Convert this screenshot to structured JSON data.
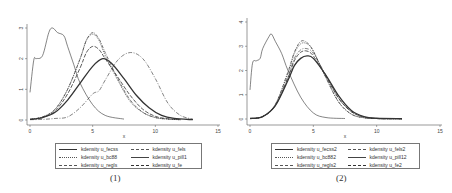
{
  "figure": {
    "panels": [
      {
        "label": "(1)",
        "xlabel": "x"
      },
      {
        "label": "(2)",
        "xlabel": "x"
      }
    ]
  },
  "chart_data": [
    {
      "type": "line",
      "title": "(1)",
      "xlabel": "x",
      "ylabel": "",
      "xlim": [
        0,
        15
      ],
      "ylim": [
        0,
        3
      ],
      "xticks": [
        0,
        5,
        10,
        15
      ],
      "yticks": [
        0,
        1,
        2,
        3
      ],
      "grid": false,
      "legend_position": "bottom",
      "series": [
        {
          "name": "kdensity u_fecss",
          "style": "solid-thick",
          "x": [
            0,
            1,
            2,
            3,
            4,
            5,
            5.8,
            6.5,
            7.5,
            8.5,
            9.5,
            10.5,
            11.5,
            13
          ],
          "y": [
            0.02,
            0.08,
            0.25,
            0.65,
            1.2,
            1.75,
            2.0,
            1.85,
            1.35,
            0.8,
            0.4,
            0.15,
            0.05,
            0.01
          ]
        },
        {
          "name": "kdensity u_bc88",
          "style": "dotted",
          "x": [
            0,
            1,
            2,
            3,
            4,
            4.5,
            5,
            5.5,
            6,
            7,
            8,
            9,
            10,
            11,
            12
          ],
          "y": [
            0.02,
            0.1,
            0.35,
            1.0,
            2.0,
            2.6,
            2.8,
            2.6,
            2.1,
            1.3,
            0.6,
            0.25,
            0.08,
            0.03,
            0.01
          ]
        },
        {
          "name": "kdensity u_regls",
          "style": "dash-dot",
          "x": [
            0,
            1,
            2,
            3,
            4,
            4.5,
            5,
            5.5,
            6,
            7,
            8,
            9,
            10,
            11,
            12
          ],
          "y": [
            0.02,
            0.1,
            0.35,
            1.0,
            2.0,
            2.6,
            2.85,
            2.65,
            2.2,
            1.35,
            0.65,
            0.25,
            0.08,
            0.03,
            0.01
          ]
        },
        {
          "name": "kdensity u_fels",
          "style": "long-dash-dot",
          "x": [
            0,
            1,
            2,
            3,
            4,
            5,
            5.5,
            6,
            7,
            8,
            9,
            10,
            11,
            12,
            13
          ],
          "y": [
            0.01,
            0.02,
            0.05,
            0.1,
            0.4,
            0.85,
            0.95,
            1.3,
            1.95,
            2.2,
            2.0,
            1.35,
            0.55,
            0.15,
            0.03
          ]
        },
        {
          "name": "kdensity u_pill1",
          "style": "solid-thin",
          "x": [
            0,
            0.3,
            0.5,
            1,
            1.5,
            1.8,
            2.2,
            2.7,
            3,
            3.5,
            4,
            5,
            6,
            7.5
          ],
          "y": [
            0.9,
            1.95,
            2.0,
            2.1,
            2.85,
            3.0,
            2.85,
            2.75,
            2.4,
            1.8,
            1.2,
            0.5,
            0.15,
            0.03
          ]
        },
        {
          "name": "kdensity u_fe",
          "style": "long-dash",
          "x": [
            0,
            1,
            2,
            3,
            4,
            4.5,
            5,
            5.5,
            6,
            7,
            8,
            9,
            10,
            11,
            12
          ],
          "y": [
            0.02,
            0.08,
            0.3,
            0.85,
            1.7,
            2.2,
            2.4,
            2.3,
            2.0,
            1.4,
            0.8,
            0.35,
            0.12,
            0.04,
            0.01
          ]
        }
      ]
    },
    {
      "type": "line",
      "title": "(2)",
      "xlabel": "x",
      "ylabel": "",
      "xlim": [
        0,
        15
      ],
      "ylim": [
        0,
        4
      ],
      "xticks": [
        0,
        5,
        10,
        15
      ],
      "yticks": [
        0,
        1,
        2,
        3,
        4
      ],
      "grid": false,
      "legend_position": "bottom",
      "series": [
        {
          "name": "kdensity u_fecss2",
          "style": "solid-thick",
          "x": [
            0,
            1,
            2,
            3,
            3.5,
            4,
            4.5,
            5,
            6,
            7,
            8,
            9,
            10,
            12
          ],
          "y": [
            0.02,
            0.1,
            0.55,
            1.6,
            2.2,
            2.5,
            2.6,
            2.5,
            1.8,
            0.95,
            0.35,
            0.1,
            0.03,
            0.01
          ]
        },
        {
          "name": "kdensity u_bc882",
          "style": "dotted",
          "x": [
            0,
            1,
            2,
            3,
            3.5,
            4,
            4.5,
            5,
            6,
            7,
            8,
            9,
            10,
            12
          ],
          "y": [
            0.02,
            0.1,
            0.6,
            1.9,
            2.7,
            3.1,
            3.1,
            2.8,
            1.7,
            0.7,
            0.2,
            0.05,
            0.02,
            0.01
          ]
        },
        {
          "name": "kdensity u_regls2",
          "style": "dash-dot",
          "x": [
            0,
            1,
            2,
            3,
            3.5,
            4,
            4.5,
            5,
            6,
            7,
            8,
            9,
            10,
            12
          ],
          "y": [
            0.02,
            0.1,
            0.6,
            1.95,
            2.75,
            3.2,
            3.15,
            2.8,
            1.7,
            0.7,
            0.2,
            0.05,
            0.02,
            0.01
          ]
        },
        {
          "name": "kdensity u_fels2",
          "style": "long-dash-dot",
          "x": [
            0,
            1,
            2,
            3,
            3.5,
            4,
            4.5,
            5,
            6,
            7,
            8,
            9,
            10,
            12
          ],
          "y": [
            0.02,
            0.1,
            0.55,
            1.75,
            2.5,
            2.85,
            2.9,
            2.7,
            1.8,
            0.85,
            0.3,
            0.08,
            0.02,
            0.01
          ]
        },
        {
          "name": "kdensity u_pill12",
          "style": "solid-thin",
          "x": [
            0,
            0.2,
            0.5,
            0.8,
            1,
            1.5,
            1.7,
            2,
            2.5,
            3,
            4,
            5,
            6,
            7.5
          ],
          "y": [
            1.2,
            2.3,
            2.4,
            2.5,
            2.9,
            3.4,
            3.5,
            3.2,
            2.7,
            2.0,
            0.9,
            0.25,
            0.06,
            0.02
          ]
        },
        {
          "name": "kdensity u_fe2",
          "style": "long-dash",
          "x": [
            0,
            1,
            2,
            3,
            3.5,
            4,
            4.5,
            5,
            6,
            7,
            8,
            9,
            10,
            12
          ],
          "y": [
            0.02,
            0.1,
            0.55,
            1.7,
            2.4,
            2.75,
            2.8,
            2.6,
            1.75,
            0.85,
            0.3,
            0.08,
            0.02,
            0.01
          ]
        }
      ]
    }
  ],
  "legends": [
    {
      "items": [
        {
          "label": "kdensity u_fecss",
          "style": "solid-thick"
        },
        {
          "label": "kdensity u_fels",
          "style": "long-dash-dot"
        },
        {
          "label": "kdensity u_bc88",
          "style": "dotted"
        },
        {
          "label": "kdensity u_pill1",
          "style": "solid-thin"
        },
        {
          "label": "kdensity u_regls",
          "style": "dash-dot"
        },
        {
          "label": "kdensity u_fe",
          "style": "long-dash"
        }
      ]
    },
    {
      "items": [
        {
          "label": "kdensity u_fecss2",
          "style": "solid-thick"
        },
        {
          "label": "kdensity u_fels2",
          "style": "long-dash-dot"
        },
        {
          "label": "kdensity u_bc882",
          "style": "dotted"
        },
        {
          "label": "kdensity u_pill12",
          "style": "solid-thin"
        },
        {
          "label": "kdensity u_regls2",
          "style": "dash-dot"
        },
        {
          "label": "kdensity u_fe2",
          "style": "long-dash"
        }
      ]
    }
  ],
  "colors": {
    "line": "#333333",
    "axis": "#555555",
    "background": "#ffffff"
  }
}
